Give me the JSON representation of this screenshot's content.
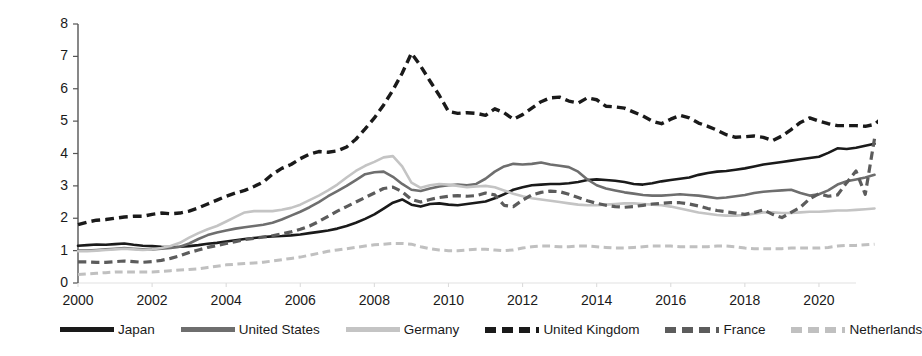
{
  "chart_data": {
    "type": "line",
    "title": "",
    "xlabel": "",
    "ylabel": "USD Trillions",
    "xlim": [
      2000,
      2021
    ],
    "ylim": [
      0,
      8
    ],
    "grid": false,
    "legend_position": "bottom",
    "ytick_labels": [
      "8",
      "7",
      "6",
      "5",
      "4",
      "3",
      "2",
      "1",
      "0"
    ],
    "ytick_values": [
      8,
      7,
      6,
      5,
      4,
      3,
      2,
      1,
      0
    ],
    "xtick_labels": [
      "2000",
      "2002",
      "2004",
      "2006",
      "2008",
      "2010",
      "2012",
      "2014",
      "2016",
      "2018",
      "2020"
    ],
    "xtick_values": [
      2000,
      2002,
      2004,
      2006,
      2008,
      2010,
      2012,
      2014,
      2016,
      2018,
      2020
    ],
    "x_step": 0.25,
    "x_start": 2000,
    "series": [
      {
        "name": "Japan",
        "color": "#1a1a1a",
        "style": "solid",
        "width": 2.6,
        "values": [
          1.15,
          1.17,
          1.19,
          1.18,
          1.2,
          1.22,
          1.18,
          1.15,
          1.14,
          1.12,
          1.11,
          1.12,
          1.14,
          1.17,
          1.21,
          1.24,
          1.28,
          1.32,
          1.36,
          1.39,
          1.42,
          1.44,
          1.45,
          1.47,
          1.5,
          1.54,
          1.58,
          1.62,
          1.68,
          1.76,
          1.86,
          1.98,
          2.12,
          2.3,
          2.48,
          2.58,
          2.42,
          2.36,
          2.44,
          2.46,
          2.42,
          2.4,
          2.44,
          2.48,
          2.52,
          2.62,
          2.74,
          2.88,
          2.96,
          3.02,
          3.04,
          3.06,
          3.06,
          3.08,
          3.12,
          3.18,
          3.2,
          3.18,
          3.16,
          3.12,
          3.06,
          3.04,
          3.08,
          3.14,
          3.18,
          3.22,
          3.26,
          3.34,
          3.4,
          3.44,
          3.46,
          3.5,
          3.54,
          3.6,
          3.66,
          3.7,
          3.74,
          3.78,
          3.82,
          3.86,
          3.9,
          4.02,
          4.16,
          4.14,
          4.18,
          4.24,
          4.3
        ]
      },
      {
        "name": "United States",
        "color": "#6e6e6e",
        "style": "solid",
        "width": 2.6,
        "values": [
          1.0,
          1.0,
          1.02,
          1.04,
          1.06,
          1.08,
          1.06,
          1.04,
          1.04,
          1.06,
          1.08,
          1.12,
          1.22,
          1.36,
          1.48,
          1.56,
          1.62,
          1.68,
          1.72,
          1.76,
          1.8,
          1.86,
          1.96,
          2.08,
          2.2,
          2.34,
          2.5,
          2.68,
          2.84,
          3.0,
          3.18,
          3.36,
          3.42,
          3.44,
          3.28,
          3.06,
          2.88,
          2.84,
          2.92,
          2.98,
          3.02,
          3.04,
          3.02,
          3.06,
          3.22,
          3.44,
          3.6,
          3.68,
          3.66,
          3.68,
          3.72,
          3.66,
          3.62,
          3.58,
          3.44,
          3.2,
          3.02,
          2.92,
          2.86,
          2.8,
          2.76,
          2.72,
          2.7,
          2.7,
          2.72,
          2.74,
          2.72,
          2.7,
          2.66,
          2.62,
          2.64,
          2.68,
          2.72,
          2.78,
          2.82,
          2.84,
          2.86,
          2.88,
          2.78,
          2.7,
          2.74,
          2.86,
          3.04,
          3.14,
          3.2,
          3.26,
          3.34
        ]
      },
      {
        "name": "Germany",
        "color": "#c4c4c4",
        "style": "solid",
        "width": 2.6,
        "values": [
          0.98,
          0.98,
          1.0,
          1.02,
          1.04,
          1.06,
          1.04,
          1.02,
          1.04,
          1.08,
          1.14,
          1.24,
          1.4,
          1.54,
          1.66,
          1.76,
          1.9,
          2.04,
          2.18,
          2.22,
          2.22,
          2.22,
          2.26,
          2.32,
          2.42,
          2.56,
          2.7,
          2.86,
          3.04,
          3.26,
          3.46,
          3.62,
          3.74,
          3.88,
          3.92,
          3.6,
          3.1,
          2.94,
          3.02,
          3.06,
          3.04,
          3.0,
          2.96,
          2.98,
          3.0,
          2.96,
          2.86,
          2.76,
          2.68,
          2.62,
          2.58,
          2.54,
          2.5,
          2.46,
          2.42,
          2.4,
          2.4,
          2.42,
          2.44,
          2.46,
          2.46,
          2.44,
          2.42,
          2.4,
          2.36,
          2.3,
          2.24,
          2.18,
          2.14,
          2.1,
          2.08,
          2.08,
          2.1,
          2.14,
          2.18,
          2.18,
          2.16,
          2.16,
          2.18,
          2.2,
          2.2,
          2.22,
          2.24,
          2.24,
          2.26,
          2.28,
          2.3
        ]
      },
      {
        "name": "United Kingdom",
        "color": "#1a1a1a",
        "style": "dashed",
        "width": 3.4,
        "values": [
          1.8,
          1.88,
          1.94,
          1.96,
          2.0,
          2.04,
          2.06,
          2.06,
          2.12,
          2.16,
          2.14,
          2.16,
          2.22,
          2.32,
          2.44,
          2.56,
          2.68,
          2.78,
          2.86,
          2.98,
          3.12,
          3.36,
          3.54,
          3.66,
          3.84,
          3.98,
          4.06,
          4.04,
          4.08,
          4.2,
          4.44,
          4.76,
          5.1,
          5.5,
          5.96,
          6.48,
          7.1,
          6.7,
          6.24,
          5.8,
          5.3,
          5.24,
          5.26,
          5.24,
          5.18,
          5.38,
          5.26,
          5.06,
          5.2,
          5.4,
          5.6,
          5.72,
          5.74,
          5.62,
          5.56,
          5.72,
          5.66,
          5.46,
          5.44,
          5.4,
          5.28,
          5.16,
          5.0,
          4.92,
          5.06,
          5.18,
          5.1,
          4.94,
          4.84,
          4.72,
          4.58,
          4.5,
          4.52,
          4.54,
          4.5,
          4.4,
          4.54,
          4.74,
          4.96,
          5.1,
          5.0,
          4.92,
          4.86,
          4.86,
          4.86,
          4.84,
          4.9,
          5.14,
          5.0,
          5.14,
          5.4
        ]
      },
      {
        "name": "France",
        "color": "#5c5c5c",
        "style": "dashed",
        "width": 3.2,
        "values": [
          0.65,
          0.65,
          0.64,
          0.64,
          0.66,
          0.68,
          0.66,
          0.64,
          0.66,
          0.7,
          0.76,
          0.84,
          0.94,
          1.02,
          1.1,
          1.16,
          1.22,
          1.28,
          1.34,
          1.38,
          1.42,
          1.46,
          1.52,
          1.58,
          1.66,
          1.76,
          1.9,
          2.06,
          2.22,
          2.36,
          2.5,
          2.64,
          2.78,
          2.92,
          2.96,
          2.82,
          2.58,
          2.5,
          2.58,
          2.64,
          2.68,
          2.7,
          2.68,
          2.7,
          2.78,
          2.72,
          2.4,
          2.36,
          2.56,
          2.72,
          2.8,
          2.84,
          2.82,
          2.74,
          2.64,
          2.54,
          2.46,
          2.4,
          2.36,
          2.34,
          2.36,
          2.4,
          2.44,
          2.46,
          2.48,
          2.48,
          2.44,
          2.38,
          2.3,
          2.24,
          2.2,
          2.16,
          2.12,
          2.18,
          2.26,
          2.12,
          2.02,
          2.18,
          2.34,
          2.6,
          2.76,
          2.68,
          2.72,
          3.1,
          3.46,
          2.74,
          4.46
        ]
      },
      {
        "name": "Netherlands",
        "color": "#c0c0c0",
        "style": "dashed",
        "width": 3.0,
        "values": [
          0.26,
          0.28,
          0.3,
          0.32,
          0.34,
          0.34,
          0.34,
          0.34,
          0.34,
          0.36,
          0.38,
          0.4,
          0.42,
          0.44,
          0.48,
          0.52,
          0.56,
          0.58,
          0.6,
          0.62,
          0.64,
          0.68,
          0.72,
          0.76,
          0.8,
          0.86,
          0.92,
          0.98,
          1.02,
          1.06,
          1.1,
          1.14,
          1.18,
          1.2,
          1.22,
          1.22,
          1.2,
          1.12,
          1.06,
          1.02,
          1.0,
          1.0,
          1.02,
          1.04,
          1.04,
          1.02,
          1.0,
          1.02,
          1.08,
          1.12,
          1.14,
          1.14,
          1.12,
          1.12,
          1.14,
          1.14,
          1.12,
          1.1,
          1.08,
          1.08,
          1.1,
          1.12,
          1.14,
          1.14,
          1.14,
          1.12,
          1.12,
          1.12,
          1.12,
          1.14,
          1.14,
          1.12,
          1.08,
          1.06,
          1.06,
          1.06,
          1.06,
          1.08,
          1.08,
          1.08,
          1.08,
          1.1,
          1.14,
          1.16,
          1.16,
          1.18,
          1.2
        ]
      }
    ]
  },
  "legend": {
    "entries": [
      {
        "label": "Japan",
        "color": "#1a1a1a",
        "style": "solid"
      },
      {
        "label": "United States",
        "color": "#6e6e6e",
        "style": "solid"
      },
      {
        "label": "Germany",
        "color": "#c4c4c4",
        "style": "solid"
      },
      {
        "label": "United Kingdom",
        "color": "#1a1a1a",
        "style": "dashed"
      },
      {
        "label": "France",
        "color": "#5c5c5c",
        "style": "dashed"
      },
      {
        "label": "Netherlands",
        "color": "#c0c0c0",
        "style": "dashed"
      }
    ]
  },
  "axes": {
    "y_axis_label": "USD Trillions"
  }
}
